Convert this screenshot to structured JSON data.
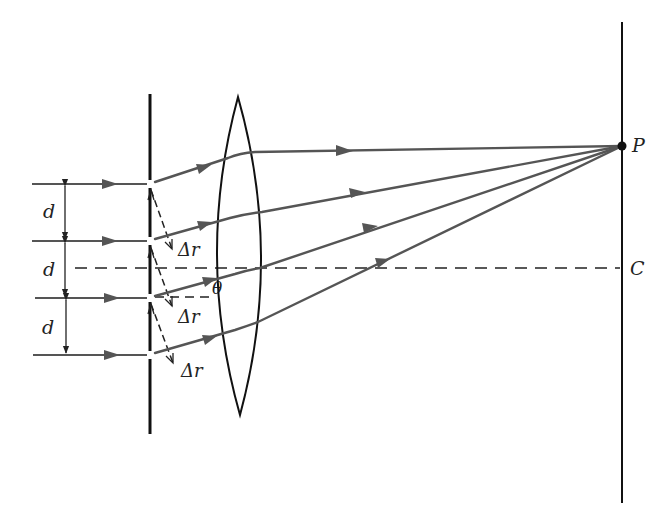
{
  "colors": {
    "ray": "#555555",
    "structure": "#111111",
    "background": "#ffffff"
  },
  "labels": {
    "slit_spacing": [
      "d",
      "d",
      "d"
    ],
    "path_difference": [
      "Δr",
      "Δr",
      "Δr"
    ],
    "angle": "θ",
    "point_p": "P",
    "center_c": "C"
  },
  "geometry": {
    "incoming_ray_y": [
      184,
      241,
      298,
      355
    ],
    "barrier_x": 150,
    "lens_center_x": 239,
    "lens_top_y": 97,
    "lens_bottom_y": 415,
    "screen_x": 622,
    "axis_y": 268,
    "focus_p": [
      622,
      146
    ]
  },
  "components": [
    {
      "name": "incident-rays",
      "count": 4
    },
    {
      "name": "slit-barrier",
      "slits": 4
    },
    {
      "name": "converging-lens"
    },
    {
      "name": "screen"
    }
  ]
}
